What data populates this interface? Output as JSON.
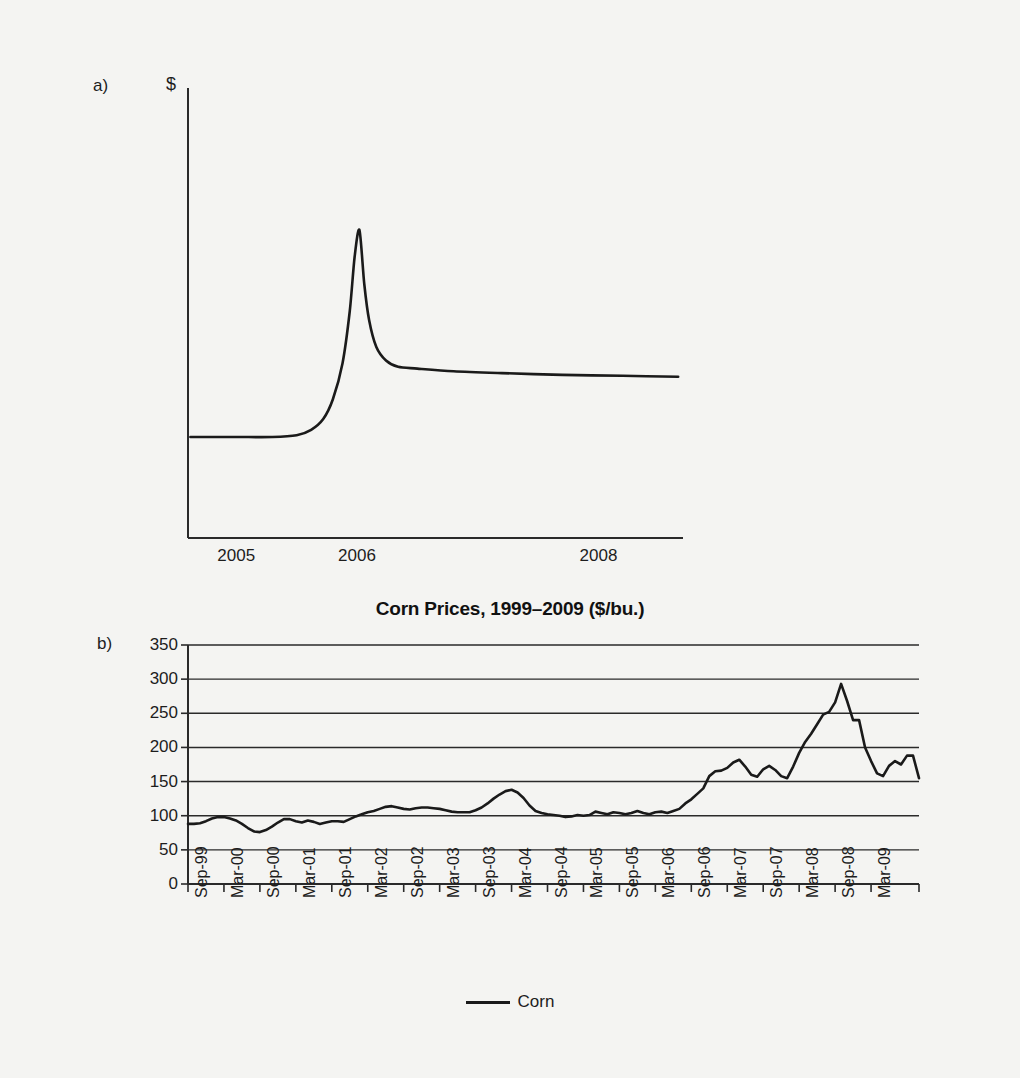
{
  "figure": {
    "background_color": "#f4f4f2",
    "line_color": "#1a1a1a"
  },
  "panel_a": {
    "letter": "a)",
    "ylabel": "$",
    "xticks": [
      "2005",
      "2006",
      "2008"
    ],
    "chart_data": {
      "type": "line",
      "title": "",
      "xlabel": "",
      "ylabel": "$",
      "xlim": [
        2004.6,
        2008.7
      ],
      "tick_values": [
        2005,
        2006,
        2008
      ],
      "grid": false,
      "legend": "none",
      "description": "Stylized price spike: flat baseline through 2005, sharp rise peaking at 2006, rapid fall then slow decay to a level above the original baseline.",
      "series": [
        {
          "name": "stylized price",
          "x": [
            2004.62,
            2005.0,
            2005.3,
            2005.5,
            2005.62,
            2005.72,
            2005.8,
            2005.88,
            2005.94,
            2005.98,
            2006.02,
            2006.06,
            2006.1,
            2006.16,
            2006.24,
            2006.34,
            2006.5,
            2006.8,
            2007.2,
            2007.7,
            2008.2,
            2008.66
          ],
          "y": [
            1.0,
            1.0,
            1.0,
            1.02,
            1.08,
            1.2,
            1.42,
            1.82,
            2.4,
            3.0,
            3.3,
            2.7,
            2.3,
            2.0,
            1.85,
            1.78,
            1.76,
            1.73,
            1.71,
            1.69,
            1.68,
            1.67
          ]
        }
      ]
    }
  },
  "panel_b": {
    "letter": "b)",
    "title": "Corn Prices, 1999–2009 ($/bu.)",
    "legend_label": "Corn",
    "chart_data": {
      "type": "line",
      "title": "Corn Prices, 1999–2009 ($/bu.)",
      "xlabel": "",
      "ylabel": "",
      "ylim": [
        0,
        350
      ],
      "yticks": [
        350,
        300,
        250,
        200,
        150,
        100,
        50,
        0
      ],
      "grid": true,
      "grid_axis": "y",
      "legend": "bottom-center",
      "xticks": [
        "Sep-99",
        "Mar-00",
        "Sep-00",
        "Mar-01",
        "Sep-01",
        "Mar-02",
        "Sep-02",
        "Mar-03",
        "Sep-03",
        "Mar-04",
        "Sep-04",
        "Mar-05",
        "Sep-05",
        "Mar-06",
        "Sep-06",
        "Mar-07",
        "Sep-07",
        "Mar-08",
        "Sep-08",
        "Mar-09"
      ],
      "series": [
        {
          "name": "Corn",
          "x": [
            "Sep-99",
            "Oct-99",
            "Nov-99",
            "Dec-99",
            "Jan-00",
            "Feb-00",
            "Mar-00",
            "Apr-00",
            "May-00",
            "Jun-00",
            "Jul-00",
            "Aug-00",
            "Sep-00",
            "Oct-00",
            "Nov-00",
            "Dec-00",
            "Jan-01",
            "Feb-01",
            "Mar-01",
            "Apr-01",
            "May-01",
            "Jun-01",
            "Jul-01",
            "Aug-01",
            "Sep-01",
            "Oct-01",
            "Nov-01",
            "Dec-01",
            "Jan-02",
            "Feb-02",
            "Mar-02",
            "Apr-02",
            "May-02",
            "Jun-02",
            "Jul-02",
            "Aug-02",
            "Sep-02",
            "Oct-02",
            "Nov-02",
            "Dec-02",
            "Jan-03",
            "Feb-03",
            "Mar-03",
            "Apr-03",
            "May-03",
            "Jun-03",
            "Jul-03",
            "Aug-03",
            "Sep-03",
            "Oct-03",
            "Nov-03",
            "Dec-03",
            "Jan-04",
            "Feb-04",
            "Mar-04",
            "Apr-04",
            "May-04",
            "Jun-04",
            "Jul-04",
            "Aug-04",
            "Sep-04",
            "Oct-04",
            "Nov-04",
            "Dec-04",
            "Jan-05",
            "Feb-05",
            "Mar-05",
            "Apr-05",
            "May-05",
            "Jun-05",
            "Jul-05",
            "Aug-05",
            "Sep-05",
            "Oct-05",
            "Nov-05",
            "Dec-05",
            "Jan-06",
            "Feb-06",
            "Mar-06",
            "Apr-06",
            "May-06",
            "Jun-06",
            "Jul-06",
            "Aug-06",
            "Sep-06",
            "Oct-06",
            "Nov-06",
            "Dec-06",
            "Jan-07",
            "Feb-07",
            "Mar-07",
            "Apr-07",
            "May-07",
            "Jun-07",
            "Jul-07",
            "Aug-07",
            "Sep-07",
            "Oct-07",
            "Nov-07",
            "Dec-07",
            "Jan-08",
            "Feb-08",
            "Mar-08",
            "Apr-08",
            "May-08",
            "Jun-08",
            "Jul-08",
            "Aug-08",
            "Sep-08",
            "Oct-08",
            "Nov-08",
            "Dec-08",
            "Jan-09",
            "Feb-09",
            "Mar-09",
            "Apr-09",
            "May-09",
            "Jun-09",
            "Jul-09",
            "Aug-09",
            "Sep-09"
          ],
          "values": [
            88,
            88,
            89,
            92,
            96,
            98,
            98,
            96,
            93,
            88,
            82,
            77,
            76,
            79,
            84,
            90,
            95,
            95,
            92,
            90,
            93,
            91,
            88,
            90,
            92,
            92,
            91,
            95,
            99,
            102,
            105,
            107,
            110,
            113,
            114,
            112,
            110,
            109,
            111,
            112,
            112,
            111,
            110,
            108,
            106,
            105,
            105,
            105,
            108,
            112,
            118,
            125,
            131,
            136,
            138,
            134,
            126,
            115,
            107,
            104,
            102,
            101,
            100,
            98,
            99,
            101,
            100,
            101,
            106,
            104,
            102,
            105,
            104,
            102,
            104,
            107,
            104,
            102,
            105,
            106,
            104,
            107,
            110,
            118,
            124,
            132,
            140,
            158,
            165,
            166,
            170,
            178,
            182,
            172,
            160,
            157,
            168,
            173,
            167,
            158,
            155,
            172,
            192,
            208,
            220,
            234,
            248,
            252,
            266,
            293,
            268,
            240,
            240,
            200,
            180,
            162,
            158,
            173,
            180,
            175,
            188,
            188,
            155
          ]
        }
      ]
    }
  }
}
